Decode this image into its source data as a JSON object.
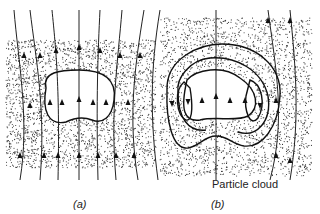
{
  "figure": {
    "panels": [
      {
        "id": "a",
        "caption": "(a)"
      },
      {
        "id": "b",
        "caption": "(b)"
      }
    ],
    "annotation": "Particle cloud",
    "colors": {
      "ink": "#222222",
      "background": "#ffffff"
    }
  }
}
